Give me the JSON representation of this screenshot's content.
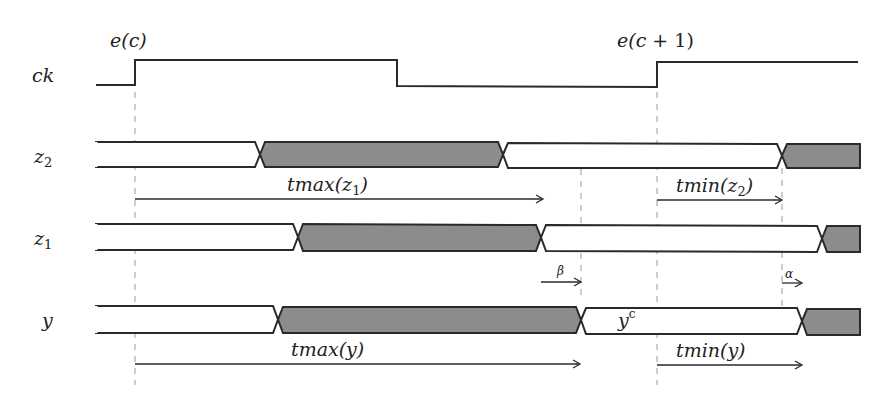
{
  "diagram": {
    "type": "timing-diagram",
    "colors": {
      "line": "#2a2a2a",
      "stable_fill": "#8c8c8c",
      "background": "#ffffff",
      "guide": "#9a9a9a"
    },
    "events": [
      {
        "label": "e(c)",
        "x": 135
      },
      {
        "label": "e(c+1)",
        "x": 657
      }
    ],
    "signals": [
      {
        "name": "ck",
        "kind": "clock",
        "transitions_x": [
          135,
          397,
          657
        ]
      },
      {
        "name": "z2",
        "kind": "bus",
        "segments": [
          {
            "from": 96,
            "to": 260,
            "state": "empty"
          },
          {
            "from": 260,
            "to": 503,
            "state": "filled"
          },
          {
            "from": 503,
            "to": 782,
            "state": "empty"
          },
          {
            "from": 782,
            "to": 858,
            "state": "filled"
          }
        ]
      },
      {
        "name": "z1",
        "kind": "bus",
        "segments": [
          {
            "from": 96,
            "to": 298,
            "state": "empty"
          },
          {
            "from": 298,
            "to": 541,
            "state": "filled"
          },
          {
            "from": 541,
            "to": 822,
            "state": "empty"
          },
          {
            "from": 822,
            "to": 858,
            "state": "filled"
          }
        ]
      },
      {
        "name": "y",
        "kind": "bus",
        "segments": [
          {
            "from": 96,
            "to": 278,
            "state": "empty"
          },
          {
            "from": 278,
            "to": 581,
            "state": "filled"
          },
          {
            "from": 581,
            "to": 802,
            "state": "empty",
            "label": "y^c"
          },
          {
            "from": 802,
            "to": 858,
            "state": "filled"
          }
        ]
      }
    ],
    "labels": {
      "ck": "ck",
      "z2": "z",
      "z2_sub": "2",
      "z1": "z",
      "z1_sub": "1",
      "y": "y",
      "e_c": "e(c)",
      "e_c1_a": "e(c",
      "e_c1_b": " + 1)",
      "y_c_base": "y",
      "y_c_sup": "c",
      "tmax_z1_a": "tmax(z",
      "tmax_z1_sub": "1",
      "tmax_z1_b": ")",
      "tmin_z2_a": "tmin(z",
      "tmin_z2_sub": "2",
      "tmin_z2_b": ")",
      "beta": "β",
      "alpha": "α",
      "tmax_y": "tmax(y)",
      "tmin_y": "tmin(y)"
    },
    "intervals": [
      {
        "label": "tmax(z1)",
        "from": 135,
        "to": 543
      },
      {
        "label": "tmin(z2)",
        "from": 657,
        "to": 782
      },
      {
        "label": "β",
        "from": 541,
        "to": 581
      },
      {
        "label": "α",
        "from": 782,
        "to": 802
      },
      {
        "label": "tmax(y)",
        "from": 135,
        "to": 580
      },
      {
        "label": "tmin(y)",
        "from": 657,
        "to": 802
      }
    ],
    "guides_x": [
      135,
      581,
      657,
      782
    ]
  }
}
